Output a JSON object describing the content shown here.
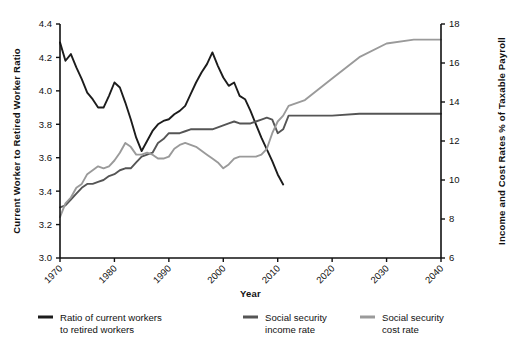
{
  "chart_data": {
    "type": "line",
    "title": "",
    "xlabel": "Year",
    "ylabel": "Current  Worker to Retired Worker Ratio",
    "y2label": "Income and Cost Rates % of Taxable Payroll",
    "xlim": [
      1970,
      2040
    ],
    "ylim": [
      3.0,
      4.4
    ],
    "y2lim": [
      6,
      18
    ],
    "xticks": [
      1970,
      1980,
      1990,
      2000,
      2010,
      2020,
      2030,
      2040
    ],
    "xtick_labels": [
      "1970",
      "1980",
      "1990",
      "2000",
      "2010",
      "2020",
      "2030",
      "2040"
    ],
    "yticks": [
      3.0,
      3.2,
      3.4,
      3.6,
      3.8,
      4.0,
      4.2,
      4.4
    ],
    "ytick_labels": [
      "3.0",
      "3.2",
      "3.4",
      "3.6",
      "3.8",
      "4.0",
      "4.2",
      "4.4"
    ],
    "y2ticks": [
      6,
      8,
      10,
      12,
      14,
      16,
      18
    ],
    "y2tick_labels": [
      "6",
      "8",
      "10",
      "12",
      "14",
      "16",
      "18"
    ],
    "grid": false,
    "legend_position": "bottom",
    "series": [
      {
        "name": "Ratio of current workers to retired workers",
        "legend_label_line1": "Ratio of current workers",
        "legend_label_line2": "to retired workers",
        "axis": "left",
        "color": "#1c1c1c",
        "x": [
          1970,
          1971,
          1972,
          1973,
          1974,
          1975,
          1976,
          1977,
          1978,
          1979,
          1980,
          1981,
          1982,
          1983,
          1984,
          1985,
          1986,
          1987,
          1988,
          1989,
          1990,
          1991,
          1992,
          1993,
          1994,
          1995,
          1996,
          1997,
          1998,
          1999,
          2000,
          2001,
          2002,
          2003,
          2004,
          2005,
          2006,
          2007,
          2008,
          2009,
          2010,
          2011
        ],
        "values": [
          4.29,
          4.18,
          4.22,
          4.14,
          4.07,
          3.99,
          3.95,
          3.9,
          3.9,
          3.97,
          4.05,
          4.02,
          3.93,
          3.83,
          3.72,
          3.64,
          3.7,
          3.76,
          3.8,
          3.82,
          3.83,
          3.86,
          3.88,
          3.91,
          3.98,
          4.05,
          4.11,
          4.16,
          4.23,
          4.15,
          4.08,
          4.03,
          4.05,
          3.97,
          3.95,
          3.88,
          3.8,
          3.72,
          3.65,
          3.58,
          3.5,
          3.44
        ]
      },
      {
        "name": "Social security income rate",
        "legend_label_line1": "Social security",
        "legend_label_line2": "income rate",
        "axis": "right",
        "color": "#555555",
        "x": [
          1970,
          1971,
          1972,
          1973,
          1974,
          1975,
          1976,
          1977,
          1978,
          1979,
          1980,
          1981,
          1982,
          1983,
          1984,
          1985,
          1986,
          1987,
          1988,
          1989,
          1990,
          1991,
          1992,
          1993,
          1994,
          1995,
          1996,
          1997,
          1998,
          1999,
          2000,
          2001,
          2002,
          2003,
          2004,
          2005,
          2006,
          2007,
          2008,
          2009,
          2010,
          2011,
          2012,
          2015,
          2020,
          2025,
          2030,
          2035,
          2040
        ],
        "values": [
          8.6,
          8.7,
          9.0,
          9.3,
          9.6,
          9.8,
          9.8,
          9.9,
          10.0,
          10.2,
          10.3,
          10.5,
          10.6,
          10.6,
          10.9,
          11.2,
          11.3,
          11.4,
          11.9,
          12.1,
          12.4,
          12.4,
          12.4,
          12.5,
          12.6,
          12.6,
          12.6,
          12.6,
          12.6,
          12.7,
          12.8,
          12.9,
          13.0,
          12.9,
          12.9,
          12.9,
          13.0,
          13.1,
          13.2,
          13.1,
          12.4,
          12.6,
          13.3,
          13.3,
          13.3,
          13.4,
          13.4,
          13.4,
          13.4
        ]
      },
      {
        "name": "Social security cost rate",
        "legend_label_line1": "Social security",
        "legend_label_line2": "cost rate",
        "axis": "right",
        "color": "#9a9a9a",
        "x": [
          1970,
          1971,
          1972,
          1973,
          1974,
          1975,
          1976,
          1977,
          1978,
          1979,
          1980,
          1981,
          1982,
          1983,
          1984,
          1985,
          1986,
          1987,
          1988,
          1989,
          1990,
          1991,
          1992,
          1993,
          1994,
          1995,
          1996,
          1997,
          1998,
          1999,
          2000,
          2001,
          2002,
          2003,
          2004,
          2005,
          2006,
          2007,
          2008,
          2009,
          2010,
          2011,
          2012,
          2015,
          2020,
          2025,
          2030,
          2035,
          2040
        ],
        "values": [
          8.1,
          8.8,
          9.1,
          9.6,
          9.8,
          10.3,
          10.5,
          10.7,
          10.6,
          10.7,
          11.0,
          11.4,
          11.9,
          11.7,
          11.3,
          11.3,
          11.4,
          11.3,
          11.1,
          11.1,
          11.2,
          11.6,
          11.8,
          11.9,
          11.8,
          11.7,
          11.5,
          11.3,
          11.1,
          10.9,
          10.6,
          10.8,
          11.1,
          11.2,
          11.2,
          11.2,
          11.2,
          11.3,
          11.6,
          12.4,
          13.0,
          13.3,
          13.8,
          14.1,
          15.2,
          16.3,
          17.0,
          17.2,
          17.2
        ]
      }
    ]
  }
}
